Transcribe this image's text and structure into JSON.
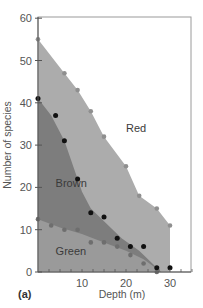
{
  "chart_data": {
    "type": "area",
    "title": "",
    "panel_label": "(a)",
    "xlabel": "Depth (m)",
    "ylabel": "Number of species",
    "xlim": [
      0,
      35
    ],
    "ylim": [
      0,
      60
    ],
    "xticks": [
      0,
      10,
      20,
      30
    ],
    "yticks": [
      0,
      10,
      20,
      30,
      40,
      50,
      60
    ],
    "x_tick_labels": [
      "10",
      "20",
      "30"
    ],
    "y_tick_labels": [
      "0",
      "10",
      "20",
      "30",
      "40",
      "50",
      "60"
    ],
    "grid": false,
    "legend": "inline region labels",
    "colors": {
      "red_region": "#acacac",
      "brown_region": "#7d7d7d",
      "green_region": "#9a9a9a",
      "red_points": "#8f8f8f",
      "brown_points": "#111111",
      "green_points": "#6e6e6e"
    },
    "series": [
      {
        "name": "Red",
        "label": "Red",
        "points": [
          [
            0,
            55
          ],
          [
            6,
            47
          ],
          [
            9,
            43
          ],
          [
            12,
            38
          ],
          [
            15,
            32
          ],
          [
            20,
            25
          ],
          [
            23,
            18
          ],
          [
            27,
            15
          ],
          [
            30,
            11
          ]
        ]
      },
      {
        "name": "Brown",
        "label": "Brown",
        "points": [
          [
            0,
            41
          ],
          [
            4,
            37
          ],
          [
            6,
            31
          ],
          [
            9,
            22
          ],
          [
            12,
            14
          ],
          [
            15,
            13
          ],
          [
            18,
            8
          ],
          [
            21,
            6
          ],
          [
            24,
            6
          ],
          [
            27,
            1
          ],
          [
            30,
            1
          ]
        ]
      },
      {
        "name": "Green",
        "label": "Green",
        "points": [
          [
            0,
            12.5
          ],
          [
            3,
            11
          ],
          [
            6,
            10
          ],
          [
            9,
            10
          ],
          [
            12,
            7
          ],
          [
            15,
            7
          ],
          [
            18,
            6
          ],
          [
            21,
            4
          ],
          [
            24,
            2
          ],
          [
            27,
            0
          ]
        ]
      }
    ],
    "region_labels": [
      {
        "text": "Red",
        "x": 20,
        "y": 33
      },
      {
        "text": "Brown",
        "x": 4,
        "y": 20
      },
      {
        "text": "Green",
        "x": 4,
        "y": 4
      }
    ]
  }
}
